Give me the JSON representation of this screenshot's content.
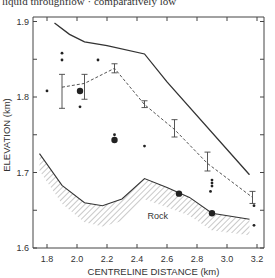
{
  "header": {
    "caption_fragment": "liquid throughflow · comparatively low"
  },
  "chart_data": {
    "type": "line",
    "title": "",
    "xlabel": "CENTRELINE DISTANCE (km)",
    "ylabel": "ELEVATION (km)",
    "xlim": [
      1.71,
      3.25
    ],
    "ylim": [
      1.6,
      1.9
    ],
    "xticks": [
      1.8,
      2.0,
      2.2,
      2.4,
      2.6,
      2.8,
      3.0,
      3.2
    ],
    "xtick_labels": [
      "1.8",
      "2.0",
      "2.2",
      "2.4",
      "2.6",
      "2.8",
      "3.0",
      "3.2"
    ],
    "yticks": [
      1.6,
      1.65,
      1.7,
      1.75,
      1.8,
      1.85,
      1.9
    ],
    "ytick_labels": [
      "1.6",
      "",
      "1.7",
      "",
      "1.8",
      "",
      "1.9"
    ],
    "grid": false,
    "legend": null,
    "series": [
      {
        "name": "Upper surface (solid)",
        "style": "solid",
        "x": [
          1.85,
          1.95,
          2.05,
          2.2,
          2.45,
          2.6,
          3.15
        ],
        "y": [
          1.898,
          1.883,
          1.873,
          1.868,
          1.857,
          1.82,
          1.697
        ]
      },
      {
        "name": "Mean profile (dashed, with error bars)",
        "style": "dashed",
        "x": [
          1.9,
          2.05,
          2.25,
          2.45,
          2.65,
          2.87,
          3.17
        ],
        "y": [
          1.813,
          1.818,
          1.838,
          1.79,
          1.757,
          1.712,
          1.667
        ],
        "err_low": [
          1.785,
          1.797,
          1.832,
          1.786,
          1.747,
          1.702,
          1.659
        ],
        "err_high": [
          1.83,
          1.83,
          1.844,
          1.795,
          1.77,
          1.727,
          1.675
        ]
      },
      {
        "name": "Rock surface (hatched below)",
        "style": "solid-hatched",
        "x": [
          1.75,
          1.9,
          2.05,
          2.17,
          2.3,
          2.45,
          2.6,
          2.75,
          2.9,
          3.15
        ],
        "y": [
          1.725,
          1.683,
          1.66,
          1.656,
          1.665,
          1.692,
          1.68,
          1.667,
          1.646,
          1.638
        ]
      }
    ],
    "points_large": [
      {
        "x": 2.02,
        "y": 1.808
      },
      {
        "x": 2.25,
        "y": 1.743
      },
      {
        "x": 2.68,
        "y": 1.672
      },
      {
        "x": 2.9,
        "y": 1.646
      }
    ],
    "points_small": [
      {
        "x": 1.8,
        "y": 1.808
      },
      {
        "x": 1.9,
        "y": 1.858
      },
      {
        "x": 1.9,
        "y": 1.849
      },
      {
        "x": 2.14,
        "y": 1.849
      },
      {
        "x": 2.02,
        "y": 1.787
      },
      {
        "x": 2.25,
        "y": 1.75
      },
      {
        "x": 2.45,
        "y": 1.735
      },
      {
        "x": 2.9,
        "y": 1.69
      },
      {
        "x": 2.9,
        "y": 1.686
      },
      {
        "x": 2.9,
        "y": 1.682
      },
      {
        "x": 2.89,
        "y": 1.675
      },
      {
        "x": 3.18,
        "y": 1.656
      },
      {
        "x": 3.18,
        "y": 1.63
      }
    ],
    "annotations": [
      {
        "text": "Rock",
        "x": 2.47,
        "y": 1.638
      }
    ]
  },
  "labels": {
    "rock": "Rock",
    "xlabel": "CENTRELINE DISTANCE (km)",
    "ylabel": "ELEVATION (km)"
  }
}
